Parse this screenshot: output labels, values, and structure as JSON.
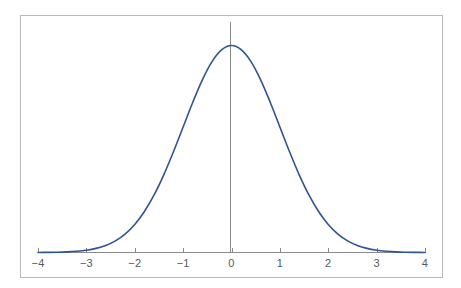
{
  "figure": {
    "background_color": "#ffffff",
    "frame_color": "#b9b9b9"
  },
  "chart_data": {
    "type": "line",
    "title": "",
    "subtitle": "",
    "xlabel": "",
    "ylabel": "",
    "xlim": [
      -4,
      4
    ],
    "ylim": [
      0,
      0.4
    ],
    "grid": false,
    "legend": null,
    "legend_position": "none",
    "axis": {
      "x_ticks": [
        -4,
        -3,
        -2,
        -1,
        0,
        1,
        2,
        3,
        4
      ],
      "x_tick_labels": [
        "−4",
        "−3",
        "−2",
        "−1",
        "0",
        "1",
        "2",
        "3",
        "4"
      ],
      "y_ticks": [],
      "y_tick_labels": [],
      "x_axis_line_color": "#8a8a8a",
      "tick_color": "#8a8a8a",
      "tick_label_color": "#585858",
      "baseline_drawn": true,
      "y_axis_drawn": false
    },
    "annotations": [
      {
        "name": "mean-vertical-line",
        "type": "vline",
        "x": 0,
        "color": "#8a8a8a",
        "width": 1,
        "label": ""
      }
    ],
    "series": [
      {
        "name": "Standard normal density",
        "color": "#31538f",
        "line_width": 1.6,
        "formula": "f(x) = (1/sqrt(2*pi)) * exp(-x^2/2)",
        "x": [
          -4,
          -3.8,
          -3.6,
          -3.4,
          -3.2,
          -3,
          -2.8,
          -2.6,
          -2.4,
          -2.2,
          -2,
          -1.8,
          -1.6,
          -1.4,
          -1.2,
          -1,
          -0.8,
          -0.6,
          -0.4,
          -0.2,
          0,
          0.2,
          0.4,
          0.6,
          0.8,
          1,
          1.2,
          1.4,
          1.6,
          1.8,
          2,
          2.2,
          2.4,
          2.6,
          2.8,
          3,
          3.2,
          3.4,
          3.6,
          3.8,
          4
        ],
        "values": [
          0.0001,
          0.0003,
          0.0006,
          0.0012,
          0.0024,
          0.0044,
          0.0079,
          0.0136,
          0.0224,
          0.0355,
          0.054,
          0.079,
          0.1109,
          0.1497,
          0.1942,
          0.242,
          0.2897,
          0.3332,
          0.3683,
          0.391,
          0.3989,
          0.391,
          0.3683,
          0.3332,
          0.2897,
          0.242,
          0.1942,
          0.1497,
          0.1109,
          0.079,
          0.054,
          0.0355,
          0.0224,
          0.0136,
          0.0079,
          0.0044,
          0.0024,
          0.0012,
          0.0006,
          0.0003,
          0.0001
        ]
      }
    ],
    "peak": {
      "x": 0,
      "y": 0.3989
    }
  }
}
